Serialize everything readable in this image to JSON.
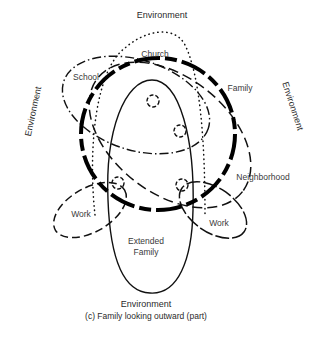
{
  "diagram": {
    "labels": {
      "environment_top": "Environment",
      "environment_left": "Environment",
      "environment_right": "Environment",
      "environment_bottom": "Environment",
      "church": "Church",
      "school": "School",
      "family": "Family",
      "neighborhood": "Neighborhood",
      "work_left": "Work",
      "work_right": "Work",
      "extended_family_line1": "Extended",
      "extended_family_line2": "Family"
    },
    "caption": "(c) Family looking outward (part)",
    "stroke_color": "#111111",
    "background": "#ffffff",
    "systems": [
      {
        "name": "Family",
        "line_style": "thick-dashed"
      },
      {
        "name": "Church",
        "line_style": "dotted"
      },
      {
        "name": "School",
        "line_style": "dash-dot"
      },
      {
        "name": "Neighborhood",
        "line_style": "long-dashed"
      },
      {
        "name": "Extended Family",
        "line_style": "solid"
      },
      {
        "name": "Work (left)",
        "line_style": "dashed"
      },
      {
        "name": "Work (right)",
        "line_style": "solid-dashed"
      }
    ],
    "members_count": 4
  }
}
